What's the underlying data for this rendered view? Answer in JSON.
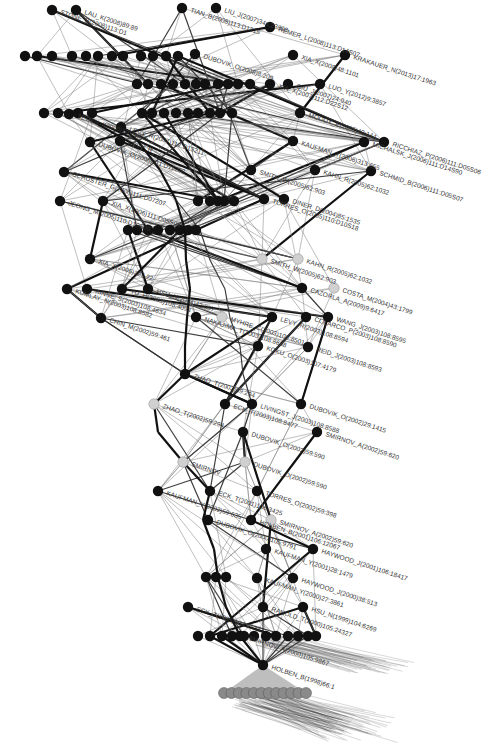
{
  "diagram": {
    "type": "citation-network",
    "title_faint": "",
    "colors": {
      "node_black": "#111111",
      "node_grey": "#d0d0d0",
      "edge": "#7a7a7a",
      "edge_strong": "#111111"
    },
    "labeled_nodes": [
      {
        "id": "n1",
        "label": "LAU_K(2008)89:89",
        "x": 76,
        "y": 10,
        "c": "black"
      },
      {
        "id": "n2",
        "label": "STONE_B(2008)113:D1",
        "x": 52,
        "y": 10,
        "c": "black"
      },
      {
        "id": "n3",
        "label": "TIAN_B(2008)113:D1215",
        "x": 182,
        "y": 8,
        "c": "black"
      },
      {
        "id": "n4",
        "label": "LIU_J(2007)34:L23808",
        "x": 216,
        "y": 8,
        "c": "black"
      },
      {
        "id": "n5",
        "label": "REMER_L(2008)113:D14S07",
        "x": 270,
        "y": 27,
        "c": "black"
      },
      {
        "id": "n6",
        "label": "XIA_X(2008)48:1101",
        "x": 293,
        "y": 55,
        "c": "black"
      },
      {
        "id": "n7",
        "label": "KRAKAUER_N(2013)17:1963",
        "x": 345,
        "y": 55,
        "c": "black"
      },
      {
        "id": "n8",
        "label": "DUBOVIK_O(2008)8:209",
        "x": 195,
        "y": 54,
        "c": "black"
      },
      {
        "id": "n9",
        "label": "QIU_J(2007)24:940",
        "x": 288,
        "y": 84,
        "c": "black"
      },
      {
        "id": "n10",
        "label": "LUO_Y(2012)9:3857",
        "x": 320,
        "y": 84,
        "c": "black"
      },
      {
        "id": "n11",
        "label": "XIA_X(2007)112:D22S12",
        "x": 270,
        "y": 84,
        "c": "black"
      },
      {
        "id": "n12",
        "label": "MOODY_E(2005)43:144",
        "x": 300,
        "y": 113,
        "c": "black"
      },
      {
        "id": "n13",
        "label": "RICCHIAZ_P(2006)111:D05S06",
        "x": 384,
        "y": 142,
        "c": "black"
      },
      {
        "id": "n14",
        "label": "MICHALSK_J(2006)111:D14S90",
        "x": 364,
        "y": 142,
        "c": "black"
      },
      {
        "id": "n15",
        "label": "KAUFMAN_Y(2006)313:655",
        "x": 293,
        "y": 141,
        "c": "black"
      },
      {
        "id": "n16",
        "label": "KAHN_R(2005)62:1032",
        "x": 315,
        "y": 170,
        "c": "black"
      },
      {
        "id": "n17",
        "label": "SCHMID_B(2006)111:D05S07",
        "x": 371,
        "y": 171,
        "c": "black"
      },
      {
        "id": "n18",
        "label": "SMITH_W(2005)62:903",
        "x": 251,
        "y": 170,
        "c": "black"
      },
      {
        "id": "n19",
        "label": "TEGEN_I(2000)105:4285",
        "x": 69,
        "y": 114,
        "c": "black"
      },
      {
        "id": "n20",
        "label": "LEVY_R(2007)112:D13211",
        "x": 121,
        "y": 127,
        "c": "black"
      },
      {
        "id": "n21",
        "label": "DUBOVIK_O(2006)111:D11208",
        "x": 90,
        "y": 142,
        "c": "black"
      },
      {
        "id": "n22",
        "label": "LEVY_R",
        "x": 120,
        "y": 141,
        "c": "black"
      },
      {
        "id": "n23",
        "label": "SCHUSTER_G(2006)111:D07207",
        "x": 64,
        "y": 172,
        "c": "black"
      },
      {
        "id": "n24",
        "label": "JEONG_M(2005)110:D10S09",
        "x": 60,
        "y": 201,
        "c": "black"
      },
      {
        "id": "n25",
        "label": "XIA_X(2006)111:D05S06",
        "x": 103,
        "y": 201,
        "c": "black"
      },
      {
        "id": "n26",
        "label": "TORRES_O(2005)110:D10S18",
        "x": 264,
        "y": 199,
        "c": "black"
      },
      {
        "id": "n27",
        "label": "DINER_D(2004)85:1535",
        "x": 284,
        "y": 199,
        "c": "black"
      },
      {
        "id": "n28",
        "label": "XIA_X(2005)32:L22",
        "x": 90,
        "y": 259,
        "c": "black"
      },
      {
        "id": "n29",
        "label": "KAHN_R(2005)62:1032",
        "x": 298,
        "y": 259,
        "c": "grey"
      },
      {
        "id": "n30",
        "label": "SMITH_W(2005)62:903",
        "x": 262,
        "y": 259,
        "c": "grey"
      },
      {
        "id": "n31",
        "label": "COSTA_M(2004)43:1799",
        "x": 334,
        "y": 288,
        "c": "grey"
      },
      {
        "id": "n32",
        "label": "CAZORLA_A(2009)9:6417",
        "x": 302,
        "y": 288,
        "c": "black"
      },
      {
        "id": "n33",
        "label": "KINNE_S(2003)108:4634",
        "x": 87,
        "y": 289,
        "c": "black"
      },
      {
        "id": "n34",
        "label": "KUMLAY_N(2003)108:8582",
        "x": 67,
        "y": 289,
        "c": "black"
      },
      {
        "id": "n35",
        "label": "YU_H(2003)108:4094",
        "x": 122,
        "y": 289,
        "c": "black"
      },
      {
        "id": "n36",
        "label": "HSU_N(2004)42:557",
        "x": 148,
        "y": 289,
        "c": "black"
      },
      {
        "id": "n37",
        "label": "WANG_J(2003)108:8595",
        "x": 328,
        "y": 317,
        "c": "black"
      },
      {
        "id": "n38",
        "label": "COLARCO_P(2003)108:8590",
        "x": 306,
        "y": 317,
        "c": "black"
      },
      {
        "id": "n39",
        "label": "LEVY_R(2003)108:8594",
        "x": 272,
        "y": 317,
        "c": "black"
      },
      {
        "id": "n40",
        "label": "REID_J(2003)108:8593",
        "x": 308,
        "y": 347,
        "c": "black"
      },
      {
        "id": "n41",
        "label": "CHIN_M(2002)59:461",
        "x": 101,
        "y": 318,
        "c": "black"
      },
      {
        "id": "n42",
        "label": "MYHRE_C(2003)108:8501",
        "x": 222,
        "y": 317,
        "c": "grey"
      },
      {
        "id": "n43",
        "label": "NAKAJIMA_T(2003)108:8658",
        "x": 196,
        "y": 317,
        "c": "black"
      },
      {
        "id": "n44",
        "label": "KOKU_O(2003)107:4179",
        "x": 258,
        "y": 346,
        "c": "black"
      },
      {
        "id": "n45",
        "label": "ZHAO_T(2002)59:294",
        "x": 185,
        "y": 374,
        "c": "black"
      },
      {
        "id": "n46",
        "label": "ZHAO_T(2002)59:294",
        "x": 154,
        "y": 404,
        "c": "grey"
      },
      {
        "id": "n47",
        "label": "ECK_T(2003)108:8477",
        "x": 225,
        "y": 404,
        "c": "black"
      },
      {
        "id": "n48",
        "label": "LIVINGST_J(2003)108:8588",
        "x": 252,
        "y": 404,
        "c": "black"
      },
      {
        "id": "n49",
        "label": "DUBOVIK_O(2002)29:1415",
        "x": 301,
        "y": 404,
        "c": "black"
      },
      {
        "id": "n50",
        "label": "DUBOVIK_O(2002)59:590",
        "x": 243,
        "y": 432,
        "c": "black"
      },
      {
        "id": "n51",
        "label": "SMIRNOV_A(2002)59:620",
        "x": 317,
        "y": 432,
        "c": "black"
      },
      {
        "id": "n52",
        "label": "SMIRNOV",
        "x": 183,
        "y": 462,
        "c": "grey"
      },
      {
        "id": "n53",
        "label": "DUBOVIK_O(2002)59:590",
        "x": 245,
        "y": 462,
        "c": "grey"
      },
      {
        "id": "n54",
        "label": "KAUFMAN_Y(2002)59:635",
        "x": 158,
        "y": 491,
        "c": "black"
      },
      {
        "id": "n55",
        "label": "ECK_T(2001)106:3425",
        "x": 210,
        "y": 491,
        "c": "black"
      },
      {
        "id": "n56",
        "label": "TORRES_O(2002)59:398",
        "x": 257,
        "y": 491,
        "c": "black"
      },
      {
        "id": "n57",
        "label": "SMIRNOV_A(2002)59:620",
        "x": 271,
        "y": 520,
        "c": "grey"
      },
      {
        "id": "n58",
        "label": "DUBOVIK_O(2000)105:9791",
        "x": 208,
        "y": 520,
        "c": "black"
      },
      {
        "id": "n59",
        "label": "HOLBEN_B(2001)106:12067",
        "x": 251,
        "y": 520,
        "c": "black"
      },
      {
        "id": "n60",
        "label": "KAUFMAN_Y(2001)28:1479",
        "x": 266,
        "y": 549,
        "c": "black"
      },
      {
        "id": "n61",
        "label": "HAYWOOD_J(2001)106:18417",
        "x": 313,
        "y": 549,
        "c": "black"
      },
      {
        "id": "n62",
        "label": "HAYWOOD_J(2000)38:513",
        "x": 293,
        "y": 578,
        "c": "black"
      },
      {
        "id": "n63",
        "label": "KAUFMAN_Y(2000)27:3861",
        "x": 257,
        "y": 578,
        "c": "black"
      },
      {
        "id": "n64",
        "label": "HSU_N(1999)104:6269",
        "x": 303,
        "y": 607,
        "c": "black"
      },
      {
        "id": "n65",
        "label": "RANOLD_T(2000)105:24327",
        "x": 263,
        "y": 607,
        "c": "black"
      },
      {
        "id": "n66",
        "label": "ECK_T(1999)104:31333",
        "x": 188,
        "y": 607,
        "c": "black"
      },
      {
        "id": "n67",
        "label": "SMIRNOV_A(2000)105:9867",
        "x": 240,
        "y": 636,
        "c": "black"
      },
      {
        "id": "n68",
        "label": "HOLBEN_B(1998)66:1",
        "x": 263,
        "y": 665,
        "c": "black"
      }
    ],
    "unlabeled_rows": [
      {
        "y": 56,
        "xs": [
          25,
          37,
          52,
          72,
          86,
          98,
          112,
          123,
          141,
          153,
          166,
          178
        ]
      },
      {
        "y": 84,
        "xs": [
          137,
          148,
          161,
          173,
          185,
          196,
          205,
          218,
          228,
          238,
          250
        ]
      },
      {
        "y": 113,
        "xs": [
          44,
          58,
          78,
          92,
          142,
          152,
          164,
          176,
          188,
          198,
          210,
          220,
          232
        ]
      },
      {
        "y": 201,
        "xs": [
          198,
          210,
          218,
          224,
          234
        ]
      },
      {
        "y": 230,
        "xs": [
          128,
          137,
          148,
          158,
          170,
          180,
          188,
          196
        ]
      },
      {
        "y": 577,
        "xs": [
          206,
          216,
          226
        ]
      },
      {
        "y": 636,
        "xs": [
          198,
          210,
          222,
          232,
          244,
          254,
          266,
          276,
          288,
          298,
          308,
          316
        ]
      }
    ],
    "bottom_cluster": {
      "count": 12,
      "y": 693,
      "x_start": 224,
      "x_end": 306,
      "label_overflow": "dense overlapping reference labels"
    }
  }
}
